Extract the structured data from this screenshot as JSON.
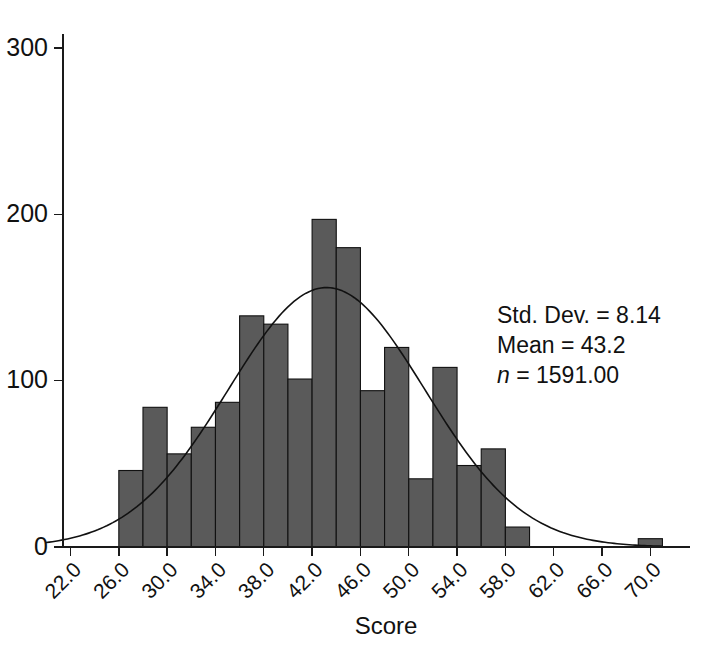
{
  "chart_data": {
    "type": "bar",
    "title": "",
    "subtitle": "",
    "xlabel": "Score",
    "ylabel": "",
    "xlim": [
      20.0,
      71.0
    ],
    "ylim": [
      0,
      300
    ],
    "grid": false,
    "legend": "none",
    "bin_width": 2.0,
    "xticks": [
      "22.0",
      "26.0",
      "30.0",
      "34.0",
      "38.0",
      "42.0",
      "46.0",
      "50.0",
      "54.0",
      "58.0",
      "62.0",
      "66.0",
      "70.0"
    ],
    "xtick_values": [
      22.0,
      26.0,
      30.0,
      34.0,
      38.0,
      42.0,
      46.0,
      50.0,
      54.0,
      58.0,
      62.0,
      66.0,
      70.0
    ],
    "yticks": [
      "0",
      "100",
      "200",
      "300"
    ],
    "ytick_values": [
      0,
      100,
      200,
      300
    ],
    "bin_centers": [
      21.0,
      27.0,
      29.0,
      31.0,
      33.0,
      35.0,
      37.0,
      39.0,
      41.0,
      43.0,
      45.0,
      47.0,
      49.0,
      51.0,
      53.0,
      55.0,
      57.0,
      59.0,
      70.0
    ],
    "categories": [
      "26-28",
      "28-30",
      "30-32",
      "32-34",
      "34-36",
      "36-38",
      "38-40",
      "40-42",
      "42-44",
      "44-46",
      "46-48",
      "48-50",
      "50-52",
      "52-54",
      "54-56",
      "56-58",
      "58-60",
      "69-71"
    ],
    "values": [
      46,
      84,
      56,
      72,
      87,
      139,
      134,
      101,
      197,
      180,
      94,
      120,
      41,
      108,
      49,
      59,
      12,
      5
    ],
    "bars": [
      {
        "x0": 26.0,
        "x1": 28.0,
        "value": 46
      },
      {
        "x0": 28.0,
        "x1": 30.0,
        "value": 84
      },
      {
        "x0": 30.0,
        "x1": 32.0,
        "value": 56
      },
      {
        "x0": 32.0,
        "x1": 34.0,
        "value": 72
      },
      {
        "x0": 34.0,
        "x1": 36.0,
        "value": 87
      },
      {
        "x0": 36.0,
        "x1": 38.0,
        "value": 139
      },
      {
        "x0": 38.0,
        "x1": 40.0,
        "value": 134
      },
      {
        "x0": 40.0,
        "x1": 42.0,
        "value": 101
      },
      {
        "x0": 42.0,
        "x1": 44.0,
        "value": 197
      },
      {
        "x0": 44.0,
        "x1": 46.0,
        "value": 180
      },
      {
        "x0": 46.0,
        "x1": 48.0,
        "value": 94
      },
      {
        "x0": 48.0,
        "x1": 50.0,
        "value": 120
      },
      {
        "x0": 50.0,
        "x1": 52.0,
        "value": 41
      },
      {
        "x0": 52.0,
        "x1": 54.0,
        "value": 108
      },
      {
        "x0": 54.0,
        "x1": 56.0,
        "value": 49
      },
      {
        "x0": 56.0,
        "x1": 58.0,
        "value": 59
      },
      {
        "x0": 58.0,
        "x1": 60.0,
        "value": 12
      },
      {
        "x0": 69.0,
        "x1": 71.0,
        "value": 5
      }
    ],
    "overlay_curve": {
      "name": "normal-curve",
      "distribution": "normal",
      "mean": 43.2,
      "std_dev": 8.14,
      "n": 1591,
      "peak_value": 156
    },
    "annotations": {
      "std_dev": "Std. Dev. = 8.14",
      "mean": "Mean = 43.2",
      "n_prefix": "n",
      "n_value": " = 1591.00"
    }
  },
  "stats": {
    "std_dev_label": "Std. Dev. = 8.14",
    "mean_label": "Mean = 43.2",
    "n_italic": "n",
    "n_rest": " = 1591.00"
  },
  "axes": {
    "x_title": "Score"
  },
  "caption": {
    "text": ""
  },
  "colors": {
    "bar_fill": "#5a5a5a",
    "bar_stroke": "#111111",
    "curve": "#111111",
    "axis": "#1a1a1a",
    "background": "#ffffff"
  }
}
